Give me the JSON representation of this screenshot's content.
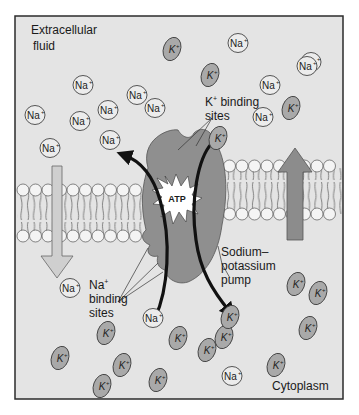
{
  "labels": {
    "extracellular_line1": "Extracellular",
    "extracellular_line2": "fluid",
    "k_binding_line1": "K",
    "k_binding_sup": "+",
    "k_binding_line1_rest": " binding",
    "k_binding_line2": "sites",
    "na_binding_line1": "Na",
    "na_binding_sup": "+",
    "na_binding_line2": "binding",
    "na_binding_line3": "sites",
    "pump_line1": "Sodium–",
    "pump_line2": "potassium",
    "pump_line3": "pump",
    "atp": "ATP",
    "cytoplasm": "Cytoplasm"
  },
  "ions": {
    "na_symbol": "Na",
    "k_symbol": "K",
    "charge": "+",
    "na_extracellular": [
      {
        "x": 83,
        "y": 85
      },
      {
        "x": 35,
        "y": 115
      },
      {
        "x": 80,
        "y": 121
      },
      {
        "x": 108,
        "y": 110
      },
      {
        "x": 137,
        "y": 95
      },
      {
        "x": 155,
        "y": 108
      },
      {
        "x": 110,
        "y": 140
      },
      {
        "x": 50,
        "y": 148
      },
      {
        "x": 238,
        "y": 43
      },
      {
        "x": 311,
        "y": 62
      },
      {
        "x": 270,
        "y": 85
      },
      {
        "x": 263,
        "y": 117
      },
      {
        "x": 307,
        "y": 66
      }
    ],
    "k_extracellular": [
      {
        "x": 172,
        "y": 49
      },
      {
        "x": 210,
        "y": 75
      },
      {
        "x": 291,
        "y": 108
      },
      {
        "x": 218,
        "y": 138
      }
    ],
    "na_cytoplasm": [
      {
        "x": 70,
        "y": 288
      },
      {
        "x": 153,
        "y": 318
      },
      {
        "x": 232,
        "y": 376
      }
    ],
    "k_cytoplasm": [
      {
        "x": 106,
        "y": 333
      },
      {
        "x": 60,
        "y": 358
      },
      {
        "x": 122,
        "y": 365
      },
      {
        "x": 102,
        "y": 386
      },
      {
        "x": 158,
        "y": 380
      },
      {
        "x": 178,
        "y": 338
      },
      {
        "x": 224,
        "y": 337
      },
      {
        "x": 230,
        "y": 317
      },
      {
        "x": 207,
        "y": 350
      },
      {
        "x": 276,
        "y": 365
      },
      {
        "x": 296,
        "y": 284
      },
      {
        "x": 318,
        "y": 293
      },
      {
        "x": 308,
        "y": 328
      }
    ]
  },
  "colors": {
    "background": "#e4e4e4",
    "frame": "#2b2b2b",
    "na_fill": "#ececec",
    "k_fill": "#a9a9a9",
    "pump_fill": "#8f8f8f",
    "arrow_fill": "#a8a8a8",
    "bilayer_head": "#f4f4f4",
    "curved_arrow": "#111111"
  }
}
